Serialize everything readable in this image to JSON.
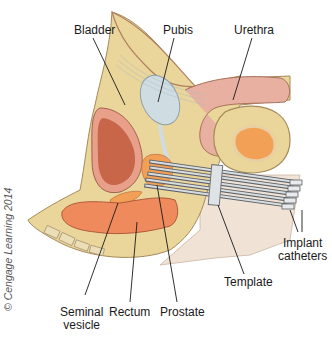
{
  "figure": {
    "labels": {
      "bladder": "Bladder",
      "pubis": "Pubis",
      "urethra": "Urethra",
      "implant_catheters_1": "Implant",
      "implant_catheters_2": "catheters",
      "template": "Template",
      "seminal_vesicle_1": "Seminal",
      "seminal_vesicle_2": "vesicle",
      "rectum": "Rectum",
      "prostate": "Prostate"
    },
    "copyright": "© Cengage Learning 2014",
    "colors": {
      "tissue_yellow": "#ead59a",
      "bladder_wall": "#e8a08a",
      "bladder_inner": "#c8664a",
      "pubis_blue": "#cfdde3",
      "urethra_pink": "#e8b0a0",
      "rectum_orange": "#ef8a5c",
      "testis_orange": "#f2a055",
      "skin_tan": "#f0e3d6",
      "catheter_gray": "#6e7378",
      "template_gray": "#dfe3e6"
    }
  }
}
